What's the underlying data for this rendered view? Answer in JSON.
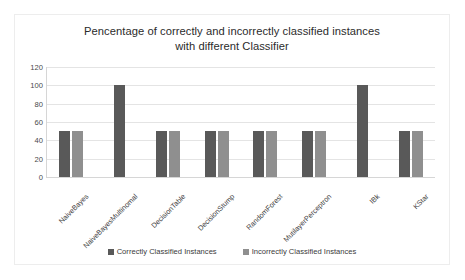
{
  "chart_data": {
    "type": "bar",
    "title": "Pencentage of correctly and incorrectly classified instances with different Classifier",
    "title_line1": "Pencentage of correctly and incorrectly classified instances",
    "title_line2": "with different Classifier",
    "xlabel": "",
    "ylabel": "",
    "ylim": [
      0,
      120
    ],
    "yticks": [
      0,
      20,
      40,
      60,
      80,
      100,
      120
    ],
    "ytick_labels": [
      "0",
      "20",
      "40",
      "60",
      "80",
      "100",
      "120"
    ],
    "grid": true,
    "legend_position": "bottom",
    "categories": [
      "NaiveBayes",
      "NaiveBayesMultinomal",
      "DecisionTable",
      "DecisionStump",
      "RandomForest",
      "MutilayerPerceptron",
      "IBk",
      "KStar"
    ],
    "series": [
      {
        "name": "Correctly Classified Instances",
        "color": "#595959",
        "values": [
          50,
          100,
          50,
          50,
          50,
          50,
          100,
          50
        ]
      },
      {
        "name": "Incorrectly Classified Instances",
        "color": "#8f8f8f",
        "values": [
          50,
          0,
          50,
          50,
          50,
          50,
          0,
          50
        ]
      }
    ]
  },
  "legend": {
    "items": [
      {
        "label": "Correctly Classified Instances",
        "color": "#595959"
      },
      {
        "label": "Incorrectly Classified Instances",
        "color": "#8f8f8f"
      }
    ]
  }
}
